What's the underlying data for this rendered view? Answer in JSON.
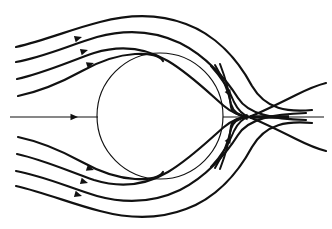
{
  "figure": {
    "background_color": "#ffffff",
    "line_color": "#111111",
    "width": 332,
    "height": 229
  },
  "chart_data": {
    "type": "line",
    "subtitle": "",
    "xlabel": "",
    "ylabel": "",
    "xlim": [
      0,
      332
    ],
    "ylim": [
      0,
      229
    ],
    "grid": false,
    "legend": "none",
    "annotations": [],
    "tick_labels": {
      "x": [],
      "y": []
    },
    "obstacle": {
      "shape": "circle",
      "center_x": 160,
      "center_y": 116,
      "radius": 63
    },
    "stagnation_point": {
      "type": "x-point",
      "x": 248,
      "y": 117
    },
    "symmetry_axis_y": 117,
    "series": [
      {
        "name": "axis-upstream",
        "kind": "axis",
        "path": "M 10 117 L 98 117",
        "arrows": [
          {
            "x": 78,
            "y": 117,
            "angle": 0
          }
        ]
      },
      {
        "name": "axis-wake-reversed",
        "kind": "axis",
        "path": "M 223 117 L 268 117",
        "arrows": [
          {
            "x": 240,
            "y": 117,
            "angle": 180
          }
        ]
      },
      {
        "name": "axis-downstream",
        "kind": "axis",
        "path": "M 268 117 L 324 117",
        "arrows": []
      },
      {
        "name": "axis-thick-segment",
        "kind": "thick",
        "path": "M 250 117 L 289 117",
        "arrows": []
      },
      {
        "name": "upper-streamline-1",
        "kind": "stream",
        "width": 2.2,
        "path": "M 16 47 C 46 40 72 29 100 22 C 130 14 160 14 186 24 C 216 35 238 60 252 86 C 266 110 288 112 312 110",
        "arrows": [
          {
            "x": 82,
            "y": 37,
            "angle": -16
          }
        ]
      },
      {
        "name": "upper-streamline-2",
        "kind": "stream",
        "width": 2.2,
        "path": "M 16 62 C 44 57 70 45 97 37 C 126 29 155 31 180 43 C 206 56 226 79 238 98 C 248 114 272 119 306 120",
        "arrows": [
          {
            "x": 88,
            "y": 50,
            "angle": -16
          }
        ]
      },
      {
        "name": "upper-streamline-3",
        "kind": "stream",
        "width": 2.2,
        "path": "M 17 79 C 44 73 68 62 94 53 C 120 45 146 48 168 61 C 190 74 210 94 224 106 C 232 113 242 116 250 117",
        "arrows": [
          {
            "x": 94,
            "y": 63,
            "angle": -18
          }
        ]
      },
      {
        "name": "upper-streamline-4",
        "kind": "stream",
        "width": 2.2,
        "path": "M 18 96 C 42 91 62 82 82 71 C 100 61 118 55 135 54 C 150 53 160 56 163 61",
        "arrows": []
      },
      {
        "name": "upper-recirc-outer",
        "kind": "stream",
        "width": 2.0,
        "path": "M 211 66 C 222 78 230 92 234 102 C 238 110 243 115 249 117",
        "arrows": [
          {
            "x": 231,
            "y": 97,
            "angle": 62
          }
        ]
      },
      {
        "name": "upper-recirc-inner",
        "kind": "stream",
        "width": 2.0,
        "path": "M 215 65 C 224 80 229 94 231 104 C 233 111 239 116 248 117",
        "arrows": []
      },
      {
        "name": "upper-separatrix-in",
        "kind": "stream",
        "width": 2.0,
        "path": "M 220 64 C 227 82 230 97 231 107 C 232 113 240 116 248 117",
        "arrows": []
      },
      {
        "name": "upper-separatrix-out",
        "kind": "stream",
        "width": 2.2,
        "path": "M 249 117 C 262 112 278 104 296 95 C 308 89 318 85 326 83",
        "arrows": []
      },
      {
        "name": "lower-streamline-1",
        "kind": "stream",
        "width": 2.2,
        "path": "M 16 186 C 46 193 72 204 100 211 C 130 219 160 219 186 209 C 216 198 238 173 252 147 C 266 123 288 121 312 123",
        "arrows": [
          {
            "x": 82,
            "y": 196,
            "angle": 16
          }
        ]
      },
      {
        "name": "lower-streamline-2",
        "kind": "stream",
        "width": 2.2,
        "path": "M 16 171 C 44 176 70 188 97 196 C 126 204 155 202 180 190 C 206 177 226 154 238 135 C 248 119 272 114 306 113",
        "arrows": [
          {
            "x": 88,
            "y": 183,
            "angle": 16
          }
        ]
      },
      {
        "name": "lower-streamline-3",
        "kind": "stream",
        "width": 2.2,
        "path": "M 17 154 C 44 160 68 171 94 180 C 120 188 146 185 168 172 C 190 159 210 139 224 127 C 232 120 242 117 250 117",
        "arrows": [
          {
            "x": 94,
            "y": 170,
            "angle": 18
          }
        ]
      },
      {
        "name": "lower-streamline-4",
        "kind": "stream",
        "width": 2.2,
        "path": "M 18 137 C 42 142 62 151 82 162 C 100 172 118 178 135 179 C 150 180 160 177 163 172",
        "arrows": []
      },
      {
        "name": "lower-recirc-outer",
        "kind": "stream",
        "width": 2.0,
        "path": "M 211 167 C 222 155 230 141 234 131 C 238 123 243 118 249 117",
        "arrows": [
          {
            "x": 231,
            "y": 136,
            "angle": -62
          }
        ]
      },
      {
        "name": "lower-recirc-inner",
        "kind": "stream",
        "width": 2.0,
        "path": "M 215 168 C 224 153 229 139 231 129 C 233 122 239 118 248 117",
        "arrows": []
      },
      {
        "name": "lower-separatrix-in",
        "kind": "stream",
        "width": 2.0,
        "path": "M 220 169 C 227 151 230 136 231 126 C 232 120 240 117 248 117",
        "arrows": []
      },
      {
        "name": "lower-separatrix-out",
        "kind": "stream",
        "width": 2.2,
        "path": "M 249 117 C 262 122 278 130 296 139 C 308 145 318 149 326 151",
        "arrows": []
      }
    ]
  }
}
